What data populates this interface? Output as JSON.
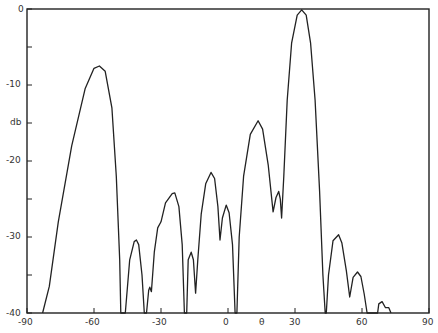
{
  "chart_data": {
    "type": "line",
    "title": "",
    "xlabel": "θ",
    "ylabel": "db",
    "xlim": [
      -90,
      90
    ],
    "ylim": [
      -40,
      0
    ],
    "grid": false,
    "legend": null,
    "x_ticks": [
      -90,
      -60,
      -30,
      0,
      30,
      60,
      90
    ],
    "x_tick_labels": [
      "-90",
      "-60",
      "-30",
      "0",
      "θ",
      "30",
      "60",
      "90"
    ],
    "y_ticks": [
      0,
      -5,
      -10,
      -15,
      -20,
      -25,
      -30,
      -35,
      -40
    ],
    "y_tick_labels": [
      "0",
      "-10",
      "db",
      "-20",
      "-30",
      "-40"
    ],
    "series": [
      {
        "name": "radiation pattern",
        "color": "#222222",
        "points": [
          [
            -83,
            -40
          ],
          [
            -80,
            -36.5
          ],
          [
            -76,
            -28
          ],
          [
            -70,
            -18
          ],
          [
            -64,
            -10.5
          ],
          [
            -60,
            -7.8
          ],
          [
            -57.6,
            -7.5
          ],
          [
            -55,
            -8.2
          ],
          [
            -52,
            -13
          ],
          [
            -50,
            -22
          ],
          [
            -48.5,
            -33
          ],
          [
            -48,
            -40
          ],
          [
            -46,
            -40
          ],
          [
            -44,
            -33
          ],
          [
            -42,
            -30.6
          ],
          [
            -41,
            -30.4
          ],
          [
            -40,
            -31
          ],
          [
            -38.5,
            -35
          ],
          [
            -37.5,
            -40
          ],
          [
            -36.5,
            -40
          ],
          [
            -35.5,
            -37
          ],
          [
            -35,
            -36.6
          ],
          [
            -34.3,
            -37.2
          ],
          [
            -33,
            -32
          ],
          [
            -31.5,
            -28.8
          ],
          [
            -30,
            -28
          ],
          [
            -28,
            -25.5
          ],
          [
            -25,
            -24.3
          ],
          [
            -23.8,
            -24.2
          ],
          [
            -22,
            -26
          ],
          [
            -20.5,
            -31
          ],
          [
            -19.5,
            -40
          ],
          [
            -18.5,
            -40
          ],
          [
            -17.8,
            -33
          ],
          [
            -16.5,
            -32
          ],
          [
            -15.5,
            -33
          ],
          [
            -14.5,
            -37.4
          ],
          [
            -13.5,
            -33
          ],
          [
            -12,
            -27
          ],
          [
            -10,
            -23
          ],
          [
            -7.6,
            -21.5
          ],
          [
            -6,
            -22.3
          ],
          [
            -4.5,
            -26
          ],
          [
            -3.6,
            -30.4
          ],
          [
            -2.5,
            -27.5
          ],
          [
            -0.8,
            -25.8
          ],
          [
            0.5,
            -26.8
          ],
          [
            2,
            -31
          ],
          [
            3.2,
            -40
          ],
          [
            4,
            -40
          ],
          [
            5,
            -30
          ],
          [
            7,
            -22
          ],
          [
            10,
            -16.5
          ],
          [
            13.5,
            -14.7
          ],
          [
            15.5,
            -15.8
          ],
          [
            18,
            -20.5
          ],
          [
            20.2,
            -26.7
          ],
          [
            21.5,
            -24.8
          ],
          [
            22.7,
            -24
          ],
          [
            23.4,
            -25
          ],
          [
            24,
            -27.5
          ],
          [
            25,
            -22
          ],
          [
            26.5,
            -12
          ],
          [
            28.5,
            -4.5
          ],
          [
            31,
            -0.8
          ],
          [
            33,
            -0.1
          ],
          [
            35,
            -0.8
          ],
          [
            37,
            -4.5
          ],
          [
            39,
            -12
          ],
          [
            41,
            -24
          ],
          [
            42.5,
            -35
          ],
          [
            43.5,
            -40
          ],
          [
            44,
            -40
          ],
          [
            45,
            -35
          ],
          [
            47,
            -30.5
          ],
          [
            49.5,
            -29.7
          ],
          [
            51,
            -30.8
          ],
          [
            53,
            -34.5
          ],
          [
            54.5,
            -37.9
          ],
          [
            56,
            -35.3
          ],
          [
            58,
            -34.6
          ],
          [
            59.5,
            -35.2
          ],
          [
            61,
            -37.5
          ],
          [
            62.3,
            -40
          ],
          [
            67,
            -40
          ],
          [
            67.5,
            -38.8
          ],
          [
            69,
            -38.5
          ],
          [
            70.5,
            -39.3
          ],
          [
            72,
            -39.3
          ],
          [
            73,
            -40
          ]
        ]
      }
    ]
  },
  "axes": {
    "y_labels": {
      "zero": "0",
      "m10": "-10",
      "unit": "db",
      "m20": "-20",
      "m30": "-30",
      "m40": "-40"
    },
    "x_labels": {
      "m90": "-90",
      "m60": "-60",
      "m30": "-30",
      "zero": "0",
      "theta": "θ",
      "p30": "30",
      "p60": "60",
      "p90": "90"
    }
  }
}
